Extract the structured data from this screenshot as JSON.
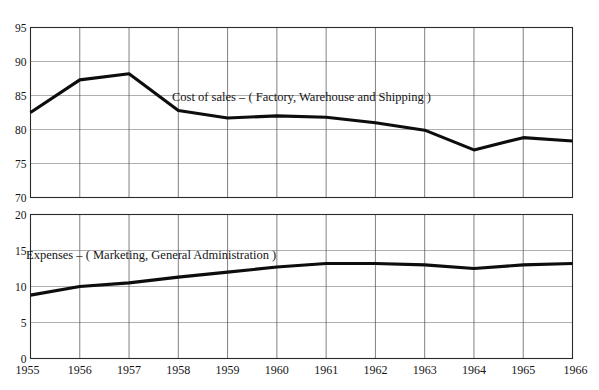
{
  "figure": {
    "clipped_header_text": "",
    "background_color": "#ffffff",
    "line_color": "#0d0d0d",
    "grid_color": "#8c8c8c"
  },
  "chart_data": [
    {
      "type": "line",
      "title": "Cost of sales – ( Factory, Warehouse and Shipping )",
      "panel": "top",
      "xlabel": "",
      "ylabel": "",
      "x": [
        1955,
        1956,
        1957,
        1958,
        1959,
        1960,
        1961,
        1962,
        1963,
        1964,
        1965,
        1966
      ],
      "categories": [
        "1955",
        "1956",
        "1957",
        "1958",
        "1959",
        "1960",
        "1961",
        "1962",
        "1963",
        "1964",
        "1965",
        "1966"
      ],
      "values": [
        82.5,
        87.3,
        88.2,
        82.8,
        81.7,
        82.0,
        81.8,
        81.0,
        79.9,
        77.0,
        78.8,
        78.3
      ],
      "ylim": [
        70,
        95
      ],
      "yticks": [
        70,
        75,
        80,
        85,
        90,
        95
      ],
      "ytick_labels": [
        "70",
        "75",
        "80",
        "85",
        "90",
        "95"
      ],
      "xlim": [
        1955,
        1966
      ],
      "grid": true,
      "legend": "inline-annotation"
    },
    {
      "type": "line",
      "title": "Expenses – ( Marketing, General Administration )",
      "panel": "bottom",
      "xlabel": "",
      "ylabel": "",
      "x": [
        1955,
        1956,
        1957,
        1958,
        1959,
        1960,
        1961,
        1962,
        1963,
        1964,
        1965,
        1966
      ],
      "categories": [
        "1955",
        "1956",
        "1957",
        "1958",
        "1959",
        "1960",
        "1961",
        "1962",
        "1963",
        "1964",
        "1965",
        "1966"
      ],
      "values": [
        8.8,
        10.0,
        10.5,
        11.3,
        12.0,
        12.7,
        13.2,
        13.2,
        13.0,
        12.5,
        13.0,
        13.2
      ],
      "ylim": [
        0,
        20
      ],
      "yticks": [
        0,
        5,
        10,
        15,
        20
      ],
      "ytick_labels": [
        "0",
        "5",
        "10",
        "15",
        "20"
      ],
      "xlim": [
        1955,
        1966
      ],
      "grid": true,
      "legend": "inline-annotation"
    }
  ]
}
